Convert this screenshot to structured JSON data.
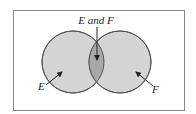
{
  "diagram": {
    "type": "venn",
    "sets": [
      {
        "id": "E",
        "label": "E",
        "cx": 73,
        "cy": 62,
        "r": 31
      },
      {
        "id": "F",
        "label": "F",
        "cx": 120,
        "cy": 62,
        "r": 31
      }
    ],
    "intersection_label": "E and F",
    "colors": {
      "frame": "#8a8a8a",
      "circle_fill": "#d4d4d4",
      "circle_stroke": "#555555",
      "intersection_fill": "#a8a8a8",
      "arrow": "#222222",
      "background": "#ffffff"
    }
  }
}
